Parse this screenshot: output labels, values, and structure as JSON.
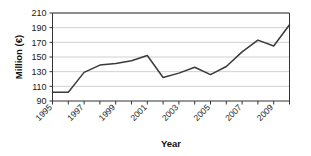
{
  "chart_data": {
    "type": "line",
    "title": "",
    "xlabel": "Year",
    "ylabel": "Million (€)",
    "x": [
      1995,
      1996,
      1997,
      1998,
      1999,
      2000,
      2001,
      2002,
      2003,
      2004,
      2005,
      2006,
      2007,
      2008,
      2009,
      2010
    ],
    "values": [
      102,
      102,
      129,
      139,
      141,
      145,
      152,
      122,
      128,
      136,
      126,
      137,
      157,
      173,
      165,
      194
    ],
    "xlim": [
      1995,
      2010
    ],
    "ylim": [
      90,
      210
    ],
    "ytick_labels": [
      "90",
      "110",
      "130",
      "150",
      "170",
      "190",
      "210"
    ],
    "yticks": [
      90,
      110,
      130,
      150,
      170,
      190,
      210
    ],
    "xtick_labels": [
      "1995",
      "1997",
      "1999",
      "2001",
      "2003",
      "2005",
      "2007",
      "2009"
    ],
    "xticks": [
      1995,
      1997,
      1999,
      2001,
      2003,
      2005,
      2007,
      2009
    ],
    "xtick_label_rotation": -45,
    "grid": "horizontal",
    "legend": "none",
    "series": [
      {
        "name": "Million (€)",
        "values": [
          102,
          102,
          129,
          139,
          141,
          145,
          152,
          122,
          128,
          136,
          126,
          137,
          157,
          173,
          165,
          194
        ]
      }
    ],
    "colors": {
      "line": "#3a3a3a",
      "grid": "#d0d0d0",
      "axis": "#333333",
      "background": "#ffffff",
      "text": "#1a1a1a"
    }
  }
}
